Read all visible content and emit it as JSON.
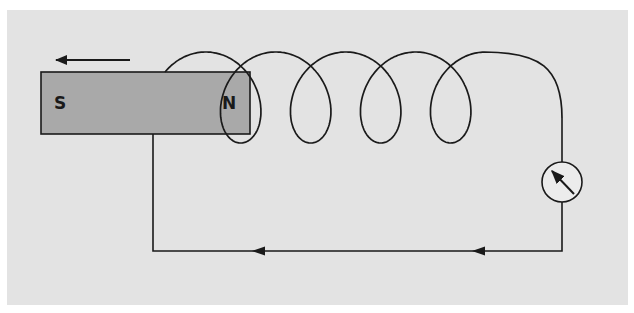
{
  "figure": {
    "panel_color": "#e3e3e3",
    "magnet": {
      "x": 41,
      "y": 72,
      "width": 209,
      "height": 62,
      "fill": "#a9a9a9",
      "stroke": "#1a1a1a",
      "south_label": "S",
      "north_label": "N"
    },
    "motion_arrow": {
      "x1": 130,
      "y1": 60,
      "x2": 56,
      "y2": 60,
      "direction": "left"
    },
    "coil": {
      "start_x": 165,
      "start_y": 72,
      "turns": 5,
      "pitch": 70,
      "radius_x": 18,
      "top_y": 52,
      "bottom_y": 143,
      "end_x": 562,
      "end_y": 118
    },
    "circuit": {
      "left_wire_x": 153,
      "bottom_wire_y": 251,
      "right_wire_x": 562,
      "current_arrows": [
        {
          "tip_x": 252,
          "y": 251,
          "direction": "left"
        },
        {
          "tip_x": 472,
          "y": 251,
          "direction": "left"
        }
      ]
    },
    "galvanometer": {
      "name": "galvanometer",
      "cx": 562,
      "cy": 182,
      "r": 20,
      "needle_icon": "needle-arrow-icon"
    },
    "stroke_color": "#1a1a1a"
  }
}
